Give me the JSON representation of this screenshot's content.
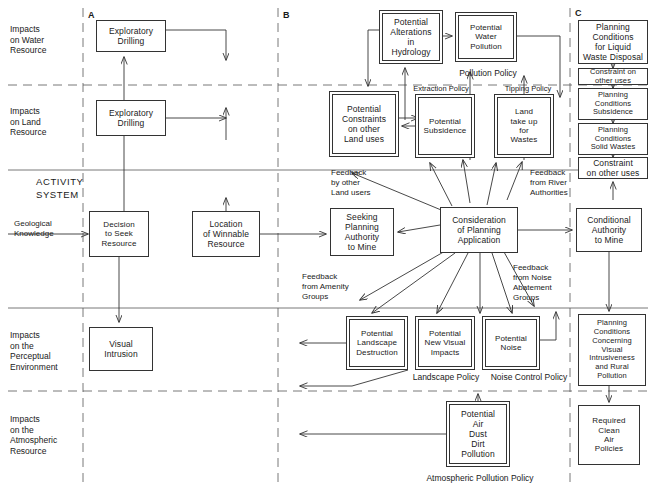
{
  "diagram": {
    "activity_system_label": "ACTIVITY\nSYSTEM",
    "columns": [
      {
        "id": "A",
        "label": "A",
        "x": 83
      },
      {
        "id": "B",
        "label": "B",
        "x": 278
      },
      {
        "id": "C",
        "label": "C",
        "x": 570
      }
    ],
    "row_labels": [
      {
        "id": "water",
        "label": "Impacts\non Water\nResource"
      },
      {
        "id": "land",
        "label": "Impacts\non Land\nResource"
      },
      {
        "id": "perceptual",
        "label": "Impacts\non the\nPerceptual\nEnvironment"
      },
      {
        "id": "atmospheric",
        "label": "Impacts\non the\nAtmospheric\nResource"
      }
    ],
    "nodes": [
      {
        "id": "exploratory-drilling-water",
        "label": "Exploratory\nDrilling",
        "x": 96,
        "y": 20,
        "w": 70,
        "h": 32,
        "double": false
      },
      {
        "id": "exploratory-drilling-land",
        "label": "Exploratory\nDrilling",
        "x": 96,
        "y": 100,
        "w": 70,
        "h": 36,
        "double": false
      },
      {
        "id": "decision-to-seek-resource",
        "label": "Decision\nto Seek\nResource",
        "x": 89,
        "y": 211,
        "w": 60,
        "h": 46,
        "double": false
      },
      {
        "id": "location-of-winnable-resource",
        "label": "Location\nof Winnable\nResource",
        "x": 192,
        "y": 211,
        "w": 68,
        "h": 46,
        "double": false
      },
      {
        "id": "visual-intrusion",
        "label": "Visual\nIntrusion",
        "x": 89,
        "y": 327,
        "w": 64,
        "h": 44,
        "double": false
      },
      {
        "id": "potential-alterations-hydrology",
        "label": "Potential\nAlterations\nin\nHydrology",
        "x": 379,
        "y": 10,
        "w": 64,
        "h": 54,
        "double": true
      },
      {
        "id": "potential-water-pollution",
        "label": "Potential\nWater\nPollution",
        "x": 455,
        "y": 12,
        "w": 62,
        "h": 50,
        "double": true
      },
      {
        "id": "potential-constraints-land-uses",
        "label": "Potential\nConstraints\non other\nLand uses",
        "x": 329,
        "y": 91,
        "w": 70,
        "h": 66,
        "double": true
      },
      {
        "id": "potential-subsidence",
        "label": "Potential\nSubsidence",
        "x": 415,
        "y": 94,
        "w": 60,
        "h": 64,
        "double": true
      },
      {
        "id": "land-take-up-for-wastes",
        "label": "Land\ntake up\nfor\nWastes",
        "x": 494,
        "y": 94,
        "w": 60,
        "h": 64,
        "double": true
      },
      {
        "id": "seeking-planning-authority",
        "label": "Seeking\nPlanning\nAuthority\nto Mine",
        "x": 330,
        "y": 208,
        "w": 64,
        "h": 48,
        "double": false
      },
      {
        "id": "consideration-planning-application",
        "label": "Consideration\nof Planning\nApplication",
        "x": 440,
        "y": 207,
        "w": 78,
        "h": 46,
        "double": false
      },
      {
        "id": "conditional-authority-to-mine",
        "label": "Conditional\nAuthority\nto Mine",
        "x": 576,
        "y": 208,
        "w": 66,
        "h": 44,
        "double": false
      },
      {
        "id": "potential-landscape-destruction",
        "label": "Potential\nLandscape\nDestruction",
        "x": 346,
        "y": 316,
        "w": 62,
        "h": 54,
        "double": true
      },
      {
        "id": "potential-new-visual-impacts",
        "label": "Potential\nNew Visual\nImpacts",
        "x": 415,
        "y": 316,
        "w": 60,
        "h": 54,
        "double": true
      },
      {
        "id": "potential-noise",
        "label": "Potential\nNoise",
        "x": 482,
        "y": 316,
        "w": 58,
        "h": 54,
        "double": true
      },
      {
        "id": "potential-air-pollution",
        "label": "Potential\nAir\nDust\nDirt\nPollution",
        "x": 446,
        "y": 401,
        "w": 64,
        "h": 66,
        "double": true
      },
      {
        "id": "planning-conditions-liquid-waste",
        "label": "Planning\nConditions\nfor Liquid\nWaste Disposal",
        "x": 578,
        "y": 20,
        "w": 70,
        "h": 44,
        "double": false
      },
      {
        "id": "constraint-other-uses-1",
        "label": "Constraint on\nother uses",
        "x": 578,
        "y": 68,
        "w": 70,
        "h": 17,
        "double": false
      },
      {
        "id": "planning-conditions-subsidence",
        "label": "Planning\nConditions\nSubsidence",
        "x": 578,
        "y": 88,
        "w": 70,
        "h": 32,
        "double": false
      },
      {
        "id": "planning-conditions-solid-wastes",
        "label": "Planning\nConditions\nSolid Wastes",
        "x": 578,
        "y": 123,
        "w": 70,
        "h": 32,
        "double": false
      },
      {
        "id": "constraint-other-uses-2",
        "label": "Constraint\non other uses",
        "x": 578,
        "y": 157,
        "w": 70,
        "h": 22,
        "double": false
      },
      {
        "id": "planning-conditions-visual",
        "label": "Planning\nConditions\nConcerning\nVisual\nIntrusiveness\nand Rural\nPollution",
        "x": 578,
        "y": 314,
        "w": 68,
        "h": 72,
        "double": false
      },
      {
        "id": "required-clean-air-policies",
        "label": "Required\nClean\nAir\nPolicies",
        "x": 578,
        "y": 405,
        "w": 62,
        "h": 60,
        "double": false
      }
    ],
    "annotations": [
      {
        "id": "geological-knowledge",
        "label": "Geological\nKnowledge",
        "x": 14,
        "y": 219,
        "w": 74,
        "size": "f8",
        "align": "left"
      },
      {
        "id": "pollution-policy",
        "label": "Pollution Policy",
        "x": 443,
        "y": 68,
        "w": 90,
        "size": "f85",
        "align": "center"
      },
      {
        "id": "extraction-policy",
        "label": "Extraction Policy",
        "x": 399,
        "y": 84,
        "w": 84,
        "size": "f75",
        "align": "center"
      },
      {
        "id": "tipping-policy",
        "label": "Tipping Policy",
        "x": 490,
        "y": 84,
        "w": 76,
        "size": "f75",
        "align": "center"
      },
      {
        "id": "feedback-by-other-land-users",
        "label": "Feedback\nby other\nLand users",
        "x": 331,
        "y": 168,
        "w": 84,
        "size": "f8",
        "align": "left"
      },
      {
        "id": "feedback-from-river-authorities",
        "label": "Feedback\nfrom River\nAuthorities",
        "x": 530,
        "y": 168,
        "w": 66,
        "size": "f8",
        "align": "left"
      },
      {
        "id": "feedback-from-amenity-groups",
        "label": "Feedback\nfrom Amenity\nGroups",
        "x": 302,
        "y": 272,
        "w": 76,
        "size": "f8",
        "align": "left"
      },
      {
        "id": "feedback-from-noise-abatement",
        "label": "Feedback\nfrom Noise\nAbatement\nGroups",
        "x": 513,
        "y": 263,
        "w": 66,
        "size": "f8",
        "align": "left"
      },
      {
        "id": "landscape-policy",
        "label": "Landscape Policy",
        "x": 403,
        "y": 372,
        "w": 86,
        "size": "f85",
        "align": "center"
      },
      {
        "id": "noise-control-policy",
        "label": "Noise Control Policy",
        "x": 478,
        "y": 372,
        "w": 102,
        "size": "f85",
        "align": "center"
      },
      {
        "id": "atmospheric-pollution-policy",
        "label": "Atmospheric Pollution Policy",
        "x": 414,
        "y": 473,
        "w": 132,
        "size": "f85",
        "align": "center"
      }
    ]
  }
}
